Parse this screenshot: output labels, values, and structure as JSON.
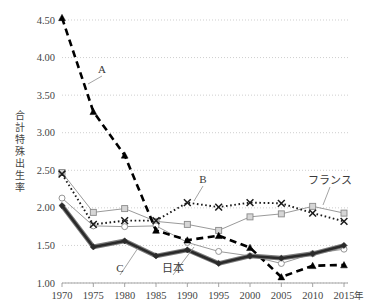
{
  "chart_data": {
    "type": "line",
    "title": "",
    "xlabel": "年",
    "ylabel": "合計特殊出生率",
    "x": [
      1970,
      1975,
      1980,
      1985,
      1990,
      1995,
      2000,
      2005,
      2010,
      2015
    ],
    "xtick_labels": [
      "1970",
      "1975",
      "1980",
      "1985",
      "1990",
      "1995",
      "2000",
      "2005",
      "2010",
      "2015"
    ],
    "ytick_labels": [
      "1.00",
      "1.50",
      "2.00",
      "2.50",
      "3.00",
      "3.50",
      "4.00",
      "4.50"
    ],
    "ytick_values": [
      1.0,
      1.5,
      2.0,
      2.5,
      3.0,
      3.5,
      4.0,
      4.5
    ],
    "ylim": [
      1.0,
      4.5
    ],
    "xlim": [
      1970,
      2015
    ],
    "grid": true,
    "legend_position": "inline-annotations",
    "series": [
      {
        "name": "A",
        "marker": "triangle",
        "style": "dashed-thick-black",
        "color": "#000000",
        "values": [
          4.53,
          3.28,
          2.7,
          1.7,
          1.57,
          1.63,
          1.47,
          1.08,
          1.23,
          1.24
        ]
      },
      {
        "name": "B",
        "marker": "cross-x",
        "style": "dotted-black",
        "color": "#1a1a1a",
        "values": [
          2.45,
          1.78,
          1.83,
          1.83,
          2.07,
          2.01,
          2.07,
          2.06,
          1.93,
          1.82
        ]
      },
      {
        "name": "C",
        "marker": "diamond",
        "style": "solid-thick-dark",
        "color": "#2b2b2b",
        "values": [
          2.03,
          1.48,
          1.56,
          1.36,
          1.44,
          1.26,
          1.36,
          1.33,
          1.39,
          1.5
        ]
      },
      {
        "name": "フランス",
        "marker": "square",
        "style": "solid-thin-gray",
        "color": "#9a9a9a",
        "values": [
          2.47,
          1.94,
          1.99,
          1.82,
          1.78,
          1.7,
          1.88,
          1.92,
          2.02,
          1.93
        ]
      },
      {
        "name": "日本",
        "marker": "circle-open",
        "style": "solid-thin-gray",
        "color": "#9a9a9a",
        "values": [
          2.13,
          1.76,
          1.75,
          1.76,
          1.54,
          1.42,
          1.36,
          1.26,
          1.39,
          1.45
        ]
      }
    ],
    "annotations": [
      {
        "label": "A",
        "series": "A",
        "text_x": 102,
        "text_y": 73,
        "point_x": 88,
        "point_y": 84
      },
      {
        "label": "B",
        "series": "B",
        "text_x": 203,
        "text_y": 183,
        "point_x": 194,
        "point_y": 201
      },
      {
        "label": "C",
        "series": "C",
        "text_x": 120,
        "text_y": 272,
        "point_x": 138,
        "point_y": 248
      },
      {
        "label": "日本",
        "series": "日本",
        "text_x": 173,
        "text_y": 272,
        "point_x": 194,
        "point_y": 247
      },
      {
        "label": "フランス",
        "series": "フランス",
        "text_x": 330,
        "text_y": 184,
        "point_x": 323,
        "point_y": 205
      }
    ]
  }
}
